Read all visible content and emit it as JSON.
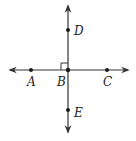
{
  "diagram": {
    "colors": {
      "line": "#333333",
      "point": "#1a1a1a",
      "label": "#222222",
      "background": "#ffffff"
    },
    "lines": [
      {
        "name": "line-AC",
        "from": [
          10,
          70
        ],
        "to": [
          128,
          70
        ],
        "arrows": "both"
      },
      {
        "name": "line-DE",
        "from": [
          68,
          6
        ],
        "to": [
          68,
          132
        ],
        "arrows": "both"
      }
    ],
    "points": [
      {
        "id": "A",
        "label": "A",
        "x": 31,
        "y": 70,
        "label_x": 27,
        "label_y": 86
      },
      {
        "id": "B",
        "label": "B",
        "x": 68,
        "y": 70,
        "label_x": 57,
        "label_y": 86
      },
      {
        "id": "C",
        "label": "C",
        "x": 107,
        "y": 70,
        "label_x": 103,
        "label_y": 86
      },
      {
        "id": "D",
        "label": "D",
        "x": 68,
        "y": 30,
        "label_x": 74,
        "label_y": 35
      },
      {
        "id": "E",
        "label": "E",
        "x": 68,
        "y": 110,
        "label_x": 74,
        "label_y": 117
      }
    ],
    "right_angle_marker": {
      "at": "B",
      "size": 7,
      "quadrant": "upper-left"
    }
  }
}
